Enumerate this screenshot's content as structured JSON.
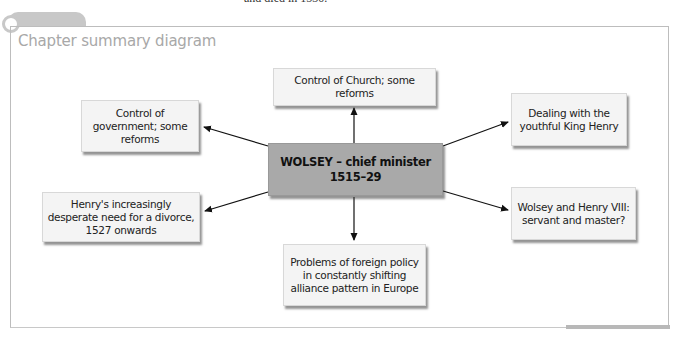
{
  "page": {
    "cut_off_text": "and died in 1530."
  },
  "diagram": {
    "title": "Chapter summary diagram",
    "center": {
      "line1": "WOLSEY – chief minister",
      "line2": "1515–29"
    },
    "nodes": [
      {
        "id": "church",
        "label": "Control of Church; some reforms"
      },
      {
        "id": "government",
        "label": "Control of government; some reforms"
      },
      {
        "id": "youthful-king",
        "label": "Dealing with the youthful King Henry"
      },
      {
        "id": "divorce",
        "label": "Henry's increasingly desperate need for a divorce, 1527 onwards"
      },
      {
        "id": "servant-master",
        "label": "Wolsey and Henry VIII: servant and master?"
      },
      {
        "id": "foreign-policy",
        "label": "Problems of foreign policy in constantly shifting alliance pattern in Europe"
      }
    ],
    "colors": {
      "center_fill": "#a9a9a9",
      "node_fill": "#f4f4f4",
      "frame": "#bdbdbd",
      "title": "#a8a8a8",
      "arrow": "#111111"
    }
  }
}
